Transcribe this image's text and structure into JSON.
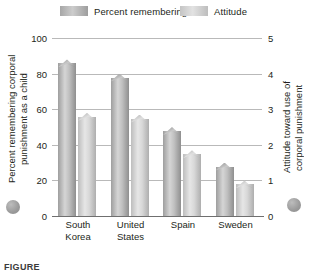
{
  "legend": {
    "items": [
      {
        "label": "Percent remembering",
        "key": "percent",
        "color": "#b4b4b4"
      },
      {
        "label": "Attitude",
        "key": "attitude",
        "color": "#d6d6d6"
      }
    ]
  },
  "axes": {
    "left": {
      "title": "Percent remembering corporal punishment as a child",
      "ticks": [
        "100",
        "80",
        "60",
        "40",
        "20",
        "0"
      ]
    },
    "right": {
      "title": "Attitude toward use of corporal punishment",
      "ticks": [
        "5",
        "4",
        "3",
        "2",
        "1",
        "0"
      ]
    }
  },
  "caption": "FIGURE",
  "chart_data": {
    "type": "bar",
    "title": "",
    "categories": [
      "South Korea",
      "United States",
      "Spain",
      "Sweden"
    ],
    "series": [
      {
        "name": "Percent remembering",
        "axis": "left",
        "values": [
          88,
          80,
          50,
          30
        ]
      },
      {
        "name": "Attitude",
        "axis": "right",
        "values": [
          2.9,
          2.85,
          1.85,
          1.0
        ]
      }
    ],
    "xlabel": "",
    "ylabel": "Percent remembering corporal punishment as a child",
    "y2label": "Attitude toward use of corporal punishment",
    "ylim": [
      0,
      100
    ],
    "y2lim": [
      0,
      5
    ],
    "yticks": [
      0,
      20,
      40,
      60,
      80,
      100
    ],
    "y2ticks": [
      0,
      1,
      2,
      3,
      4,
      5
    ],
    "grid": true,
    "legend_position": "top"
  }
}
